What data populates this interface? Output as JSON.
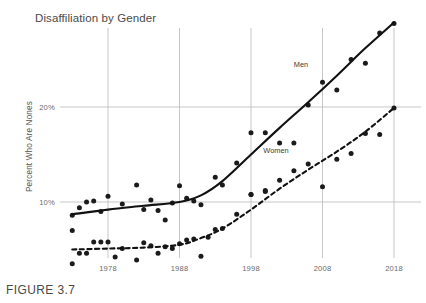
{
  "figure": {
    "caption": "FIGURE 3.7"
  },
  "chart_data": {
    "type": "scatter",
    "title": "Disaffiliation by Gender",
    "xlabel": "",
    "ylabel": "Percent Who Are Nones",
    "xlim": [
      1972,
      2019
    ],
    "ylim": [
      0,
      31
    ],
    "grid": true,
    "legend_position": "inline-annotations",
    "x_ticks": [
      1978,
      1988,
      1998,
      2008,
      2018
    ],
    "x_tick_labels": [
      "1978",
      "1988",
      "1998",
      "2008",
      "2018"
    ],
    "y_ticks": [
      10,
      20
    ],
    "y_tick_labels": [
      "10%",
      "20%"
    ],
    "annotations": [
      {
        "text": "Men",
        "x": 2005.0,
        "y": 24.2
      },
      {
        "text": "Women",
        "x": 2001.5,
        "y": 15.2
      }
    ],
    "series": [
      {
        "name": "Men",
        "marker": "filled-circle",
        "line_style": "solid",
        "color": "#111111",
        "points": [
          {
            "x": 1973,
            "y": 8.6
          },
          {
            "x": 1974,
            "y": 9.4
          },
          {
            "x": 1975,
            "y": 10.0
          },
          {
            "x": 1976,
            "y": 10.1
          },
          {
            "x": 1977,
            "y": 9.0
          },
          {
            "x": 1978,
            "y": 10.6
          },
          {
            "x": 1980,
            "y": 9.8
          },
          {
            "x": 1982,
            "y": 11.8
          },
          {
            "x": 1983,
            "y": 9.2
          },
          {
            "x": 1984,
            "y": 10.2
          },
          {
            "x": 1985,
            "y": 9.1
          },
          {
            "x": 1986,
            "y": 8.1
          },
          {
            "x": 1987,
            "y": 9.9
          },
          {
            "x": 1988,
            "y": 11.7
          },
          {
            "x": 1989,
            "y": 10.4
          },
          {
            "x": 1990,
            "y": 10.1
          },
          {
            "x": 1991,
            "y": 9.7
          },
          {
            "x": 1993,
            "y": 12.6
          },
          {
            "x": 1994,
            "y": 11.8
          },
          {
            "x": 1996,
            "y": 14.1
          },
          {
            "x": 1998,
            "y": 17.3
          },
          {
            "x": 1998,
            "y": 10.8
          },
          {
            "x": 2000,
            "y": 17.3
          },
          {
            "x": 2000,
            "y": 11.1
          },
          {
            "x": 2002,
            "y": 16.2
          },
          {
            "x": 2004,
            "y": 16.2
          },
          {
            "x": 2006,
            "y": 20.2
          },
          {
            "x": 2008,
            "y": 22.6
          },
          {
            "x": 2010,
            "y": 21.8
          },
          {
            "x": 2012,
            "y": 25.0
          },
          {
            "x": 2014,
            "y": 24.6
          },
          {
            "x": 2016,
            "y": 27.8
          },
          {
            "x": 2018,
            "y": 28.8
          }
        ],
        "trend": [
          {
            "x": 1973,
            "y": 8.7
          },
          {
            "x": 1978,
            "y": 9.2
          },
          {
            "x": 1983,
            "y": 9.6
          },
          {
            "x": 1988,
            "y": 10.0
          },
          {
            "x": 1991,
            "y": 10.7
          },
          {
            "x": 1994,
            "y": 12.2
          },
          {
            "x": 1998,
            "y": 15.0
          },
          {
            "x": 2002,
            "y": 17.8
          },
          {
            "x": 2006,
            "y": 20.5
          },
          {
            "x": 2010,
            "y": 23.3
          },
          {
            "x": 2014,
            "y": 26.2
          },
          {
            "x": 2018,
            "y": 28.9
          }
        ]
      },
      {
        "name": "Women",
        "marker": "filled-circle",
        "line_style": "dashed",
        "color": "#111111",
        "points": [
          {
            "x": 1973,
            "y": 7.0
          },
          {
            "x": 1973,
            "y": 3.5
          },
          {
            "x": 1974,
            "y": 4.6
          },
          {
            "x": 1975,
            "y": 4.6
          },
          {
            "x": 1976,
            "y": 5.8
          },
          {
            "x": 1977,
            "y": 5.8
          },
          {
            "x": 1978,
            "y": 5.8
          },
          {
            "x": 1979,
            "y": 4.2
          },
          {
            "x": 1980,
            "y": 5.1
          },
          {
            "x": 1982,
            "y": 3.9
          },
          {
            "x": 1983,
            "y": 5.7
          },
          {
            "x": 1984,
            "y": 5.4
          },
          {
            "x": 1985,
            "y": 4.6
          },
          {
            "x": 1986,
            "y": 5.3
          },
          {
            "x": 1987,
            "y": 5.1
          },
          {
            "x": 1988,
            "y": 5.6
          },
          {
            "x": 1989,
            "y": 6.0
          },
          {
            "x": 1990,
            "y": 6.1
          },
          {
            "x": 1991,
            "y": 4.3
          },
          {
            "x": 1992,
            "y": 6.3
          },
          {
            "x": 1993,
            "y": 7.1
          },
          {
            "x": 1994,
            "y": 7.2
          },
          {
            "x": 1996,
            "y": 8.7
          },
          {
            "x": 1998,
            "y": 10.8
          },
          {
            "x": 2000,
            "y": 11.2
          },
          {
            "x": 2002,
            "y": 12.3
          },
          {
            "x": 2004,
            "y": 13.3
          },
          {
            "x": 2006,
            "y": 14.0
          },
          {
            "x": 2008,
            "y": 11.6
          },
          {
            "x": 2010,
            "y": 14.5
          },
          {
            "x": 2012,
            "y": 15.1
          },
          {
            "x": 2014,
            "y": 17.2
          },
          {
            "x": 2016,
            "y": 17.1
          },
          {
            "x": 2018,
            "y": 19.9
          }
        ],
        "trend": [
          {
            "x": 1973,
            "y": 5.0
          },
          {
            "x": 1978,
            "y": 5.1
          },
          {
            "x": 1983,
            "y": 5.2
          },
          {
            "x": 1988,
            "y": 5.5
          },
          {
            "x": 1991,
            "y": 6.2
          },
          {
            "x": 1994,
            "y": 7.2
          },
          {
            "x": 1998,
            "y": 9.2
          },
          {
            "x": 2002,
            "y": 11.4
          },
          {
            "x": 2006,
            "y": 13.4
          },
          {
            "x": 2010,
            "y": 15.3
          },
          {
            "x": 2014,
            "y": 17.4
          },
          {
            "x": 2018,
            "y": 19.9
          }
        ]
      }
    ]
  }
}
